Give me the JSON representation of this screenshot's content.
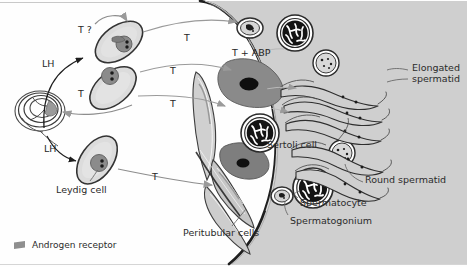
{
  "figure": {
    "width": 467,
    "height": 267,
    "background": "#fefefe"
  },
  "hormones": [
    {
      "id": "t-question",
      "text": "T ?",
      "x": 78,
      "y": 24
    },
    {
      "id": "lh-upper",
      "text": "LH",
      "x": 42,
      "y": 58
    },
    {
      "id": "t-left",
      "text": "T",
      "x": 78,
      "y": 88
    },
    {
      "id": "lh-lower",
      "text": "LH",
      "x": 44,
      "y": 143
    },
    {
      "id": "t-lower",
      "text": "T",
      "x": 152,
      "y": 171
    },
    {
      "id": "t-top-right",
      "text": "T",
      "x": 184,
      "y": 32
    },
    {
      "id": "t-mid",
      "text": "T",
      "x": 170,
      "y": 65
    },
    {
      "id": "t-mid2",
      "text": "T",
      "x": 170,
      "y": 98
    },
    {
      "id": "t-abp",
      "text": "T + ABP",
      "x": 232,
      "y": 47
    }
  ],
  "labels": [
    {
      "id": "elongated-spermatid",
      "line1": "Elongated",
      "line2": "spermatid",
      "x": 412,
      "y": 68
    },
    {
      "id": "sertoli-cell",
      "line1": "Sertoli cell",
      "line2": "",
      "x": 267,
      "y": 140
    },
    {
      "id": "round-spermatid",
      "line1": "Round spermatid",
      "line2": "",
      "x": 365,
      "y": 178
    },
    {
      "id": "spermatocyte",
      "line1": "Spermatocyte",
      "line2": "",
      "x": 300,
      "y": 200
    },
    {
      "id": "spermatogonium",
      "line1": "Spermatogonium",
      "line2": "",
      "x": 290,
      "y": 218
    },
    {
      "id": "peritubular-cells",
      "line1": "Peritubular cells",
      "line2": "",
      "x": 183,
      "y": 229
    },
    {
      "id": "leydig-cell",
      "line1": "Leydig cell",
      "line2": "",
      "x": 56,
      "y": 186
    }
  ],
  "legend": {
    "marker_name": "androgen-receptor-marker",
    "marker_color": "#8f8f8f",
    "text": "Androgen receptor"
  },
  "palette": {
    "ink": "#2b2b2b",
    "outline": "#3a3a3a",
    "tubule_fill": "#cfcfcf",
    "cell_fill": "#d8d8d8",
    "nucleus_dark": "#6e6e6e",
    "sertoli_body": "#8a8a8a",
    "sertoli_nucleus": "#111111",
    "chromatin_dark": "#1a1a1a",
    "receptor": "#8f8f8f",
    "arrow": "#7a7a7a",
    "rule": "#c9c9c9"
  },
  "structures": [
    {
      "id": "pituitary",
      "name": "pituitary-gland-ring"
    },
    {
      "id": "leydig-cell-upper",
      "name": "leydig-cell-upper"
    },
    {
      "id": "leydig-cell-middle",
      "name": "leydig-cell-middle"
    },
    {
      "id": "leydig-cell-lower",
      "name": "leydig-cell-lower"
    },
    {
      "id": "seminiferous-tubule",
      "name": "seminiferous-tubule"
    },
    {
      "id": "sertoli-cell-body-upper",
      "name": "sertoli-cell-body-upper"
    },
    {
      "id": "sertoli-cell-body-lower",
      "name": "sertoli-cell-body-lower"
    },
    {
      "id": "peritubular-cell-1",
      "name": "peritubular-cell-upper"
    },
    {
      "id": "peritubular-cell-2",
      "name": "peritubular-cell-middle"
    },
    {
      "id": "peritubular-cell-3",
      "name": "peritubular-cell-lower"
    }
  ]
}
